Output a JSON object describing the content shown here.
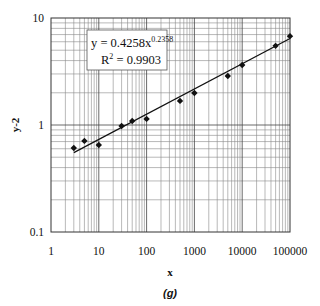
{
  "chart_data": {
    "type": "scatter",
    "title": "",
    "xlabel": "x",
    "ylabel": "y-2",
    "caption": "(g)",
    "xscale": "log",
    "yscale": "log",
    "xlim": [
      1,
      100000
    ],
    "ylim": [
      0.1,
      10
    ],
    "grid": true,
    "grid_minor": true,
    "x_ticks": [
      "1",
      "10",
      "100",
      "1000",
      "10000",
      "100000"
    ],
    "y_ticks": [
      "0.1",
      "1",
      "10"
    ],
    "series": [
      {
        "name": "data",
        "marker": "diamond",
        "x": [
          3,
          5,
          10,
          30,
          50,
          100,
          500,
          1000,
          5000,
          10000,
          50000,
          100000
        ],
        "y": [
          0.61,
          0.71,
          0.65,
          0.98,
          1.09,
          1.14,
          1.68,
          1.99,
          2.87,
          3.64,
          5.49,
          6.77
        ]
      }
    ],
    "trendline": {
      "type": "power",
      "a": 0.4258,
      "b": 0.2358,
      "x_range": [
        3,
        100000
      ],
      "r_squared": 0.9903
    },
    "annotations": {
      "equation_base": "y = 0.4258x",
      "equation_exp": "0.2358",
      "r2_base": "R",
      "r2_exp": "2",
      "r2_value": " = 0.9903"
    }
  }
}
